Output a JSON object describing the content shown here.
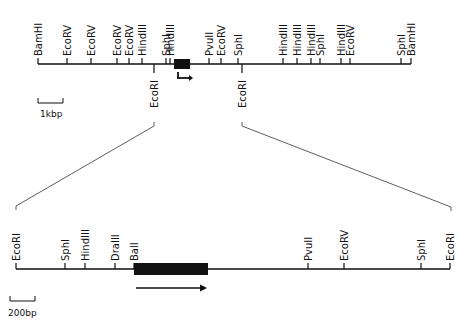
{
  "top_map": {
    "scale_label": "1kbp",
    "sites_above": [
      {
        "label": "BamHI",
        "x": 38
      },
      {
        "label": "EcoRV",
        "x": 67
      },
      {
        "label": "EcoRV",
        "x": 91
      },
      {
        "label": "EcoRV",
        "x": 117
      },
      {
        "label": "EcoRV",
        "x": 129
      },
      {
        "label": "HindIII",
        "x": 142
      },
      {
        "label": "SphI",
        "x": 166
      },
      {
        "label": "HindIII",
        "x": 170
      },
      {
        "label": "PvuII",
        "x": 209
      },
      {
        "label": "EcoRV",
        "x": 221
      },
      {
        "label": "SphI",
        "x": 238
      },
      {
        "label": "HindIII",
        "x": 283
      },
      {
        "label": "HindIII",
        "x": 297
      },
      {
        "label": "HindIII",
        "x": 311
      },
      {
        "label": "SphI",
        "x": 320
      },
      {
        "label": "HindIII",
        "x": 341
      },
      {
        "label": "EcoRV",
        "x": 350
      },
      {
        "label": "SphI",
        "x": 401
      },
      {
        "label": "BamHI",
        "x": 411
      }
    ],
    "sites_below": [
      {
        "label": "EcoRI",
        "x": 154
      },
      {
        "label": "EcoRI",
        "x": 242
      }
    ]
  },
  "bottom_map": {
    "scale_label": "200bp",
    "sites_above": [
      {
        "label": "EcoRI",
        "x": 16
      },
      {
        "label": "SphI",
        "x": 65
      },
      {
        "label": "HindIII",
        "x": 85
      },
      {
        "label": "DraIII",
        "x": 115
      },
      {
        "label": "BalI",
        "x": 134
      },
      {
        "label": "PvuII",
        "x": 308
      },
      {
        "label": "EcoRV",
        "x": 344
      },
      {
        "label": "SphI",
        "x": 421
      },
      {
        "label": "EcoRI",
        "x": 450
      }
    ]
  },
  "colors": {
    "ink": "#111111",
    "background": "#ffffff"
  }
}
